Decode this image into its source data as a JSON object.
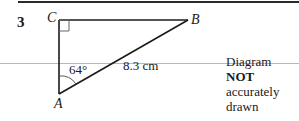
{
  "question": {
    "number": "3"
  },
  "diagram": {
    "shape": "right-angled triangle",
    "vertices": {
      "A": {
        "label": "A"
      },
      "B": {
        "label": "B"
      },
      "C": {
        "label": "C",
        "right_angle": true
      }
    },
    "angle_label": "64°",
    "side_label": "8.3 cm",
    "colors": {
      "line": "#1a1a1a",
      "right_angle_marker": "#555555"
    }
  },
  "note": {
    "line1_prefix": "Diagram ",
    "line1_bold": "NOT",
    "line2": "accurately drawn"
  }
}
